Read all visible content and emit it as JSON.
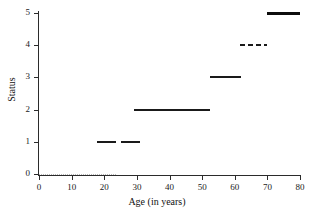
{
  "chart_data": {
    "type": "line",
    "title": "",
    "xlabel": "Age (in years)",
    "ylabel": "Status",
    "xlim": [
      0,
      80
    ],
    "ylim": [
      0,
      5
    ],
    "xticks": [
      0,
      10,
      20,
      30,
      40,
      50,
      60,
      70,
      80
    ],
    "yticks": [
      0,
      1,
      2,
      3,
      4,
      5
    ],
    "grid": false,
    "legend": null,
    "segments": [
      {
        "status": 0,
        "x_start": 0.0,
        "x_end": 24.0,
        "style": "dotted",
        "width": 1,
        "color": "#b9b9b9"
      },
      {
        "status": 1,
        "x_start": 17.8,
        "x_end": 23.6,
        "style": "solid",
        "width": 2,
        "color": "#1a1a1a"
      },
      {
        "status": 1,
        "x_start": 25.2,
        "x_end": 31.0,
        "style": "solid",
        "width": 2,
        "color": "#1a1a1a"
      },
      {
        "status": 2,
        "x_start": 29.0,
        "x_end": 52.5,
        "style": "solid",
        "width": 2,
        "color": "#1a1a1a"
      },
      {
        "status": 3,
        "x_start": 52.5,
        "x_end": 62.0,
        "style": "solid",
        "width": 2,
        "color": "#1a1a1a"
      },
      {
        "status": 4,
        "x_start": 61.5,
        "x_end": 70.0,
        "style": "dashed",
        "width": 2,
        "color": "#1a1a1a"
      },
      {
        "status": 5,
        "x_start": 70.0,
        "x_end": 80.0,
        "style": "thick",
        "width": 3,
        "color": "#0d0d0d"
      }
    ]
  },
  "axes": {
    "x": {
      "title": "Age (in years)",
      "tick_labels": [
        "0",
        "10",
        "20",
        "30",
        "40",
        "50",
        "60",
        "70",
        "80"
      ]
    },
    "y": {
      "title": "Status",
      "tick_labels": [
        "0",
        "1",
        "2",
        "3",
        "4",
        "5"
      ]
    }
  }
}
